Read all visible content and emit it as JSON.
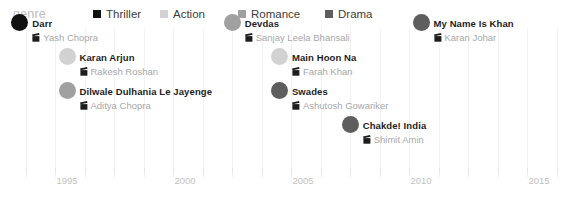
{
  "legend": {
    "title": "genre",
    "items": [
      {
        "label": "Thriller",
        "color": "#111111"
      },
      {
        "label": "Action",
        "color": "#d2d2d2"
      },
      {
        "label": "Romance",
        "color": "#a0a0a0"
      },
      {
        "label": "Drama",
        "color": "#5e5e5e"
      }
    ]
  },
  "axis": {
    "ticks": [
      {
        "label": "1995",
        "year": 1995
      },
      {
        "label": "2000",
        "year": 2000
      },
      {
        "label": "2005",
        "year": 2005
      },
      {
        "label": "2010",
        "year": 2010
      },
      {
        "label": "2015",
        "year": 2015
      }
    ]
  },
  "chart_data": {
    "type": "scatter",
    "title": "",
    "xlabel": "",
    "ylabel": "",
    "xlim": [
      1991.5,
      2016.5
    ],
    "grid": true,
    "legend_position": "top",
    "categories": [
      "Thriller",
      "Action",
      "Romance",
      "Drama"
    ],
    "category_colors": {
      "Thriller": "#111111",
      "Action": "#d2d2d2",
      "Romance": "#a0a0a0",
      "Drama": "#5e5e5e"
    },
    "points": [
      {
        "title": "Darr",
        "director": "Yash Chopra",
        "genre": "Thriller",
        "year": 1993,
        "row": 0
      },
      {
        "title": "Karan Arjun",
        "director": "Rakesh Roshan",
        "genre": "Action",
        "year": 1995,
        "row": 1
      },
      {
        "title": "Dilwale Dulhania Le Jayenge",
        "director": "Aditya Chopra",
        "genre": "Romance",
        "year": 1995,
        "row": 2
      },
      {
        "title": "Devdas",
        "director": "Sanjay Leela Bhansali",
        "genre": "Romance",
        "year": 2002,
        "row": 0
      },
      {
        "title": "Main Hoon Na",
        "director": "Farah Khan",
        "genre": "Action",
        "year": 2004,
        "row": 1
      },
      {
        "title": "Swades",
        "director": "Ashutosh Gowariker",
        "genre": "Drama",
        "year": 2004,
        "row": 2
      },
      {
        "title": "Chakde! India",
        "director": "Shimit Amin",
        "genre": "Drama",
        "year": 2007,
        "row": 3
      },
      {
        "title": "My Name Is Khan",
        "director": "Karan Johar",
        "genre": "Drama",
        "year": 2010,
        "row": 0
      }
    ]
  }
}
